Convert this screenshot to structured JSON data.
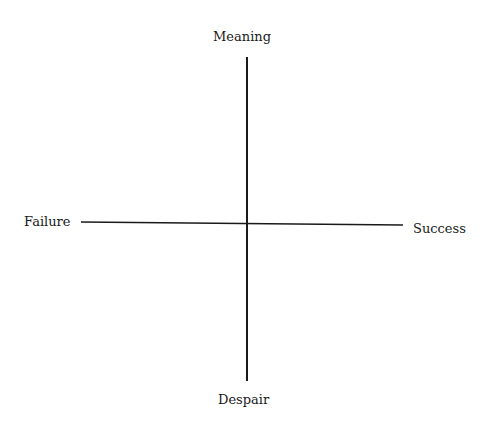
{
  "diagram": {
    "type": "quadrant-axes",
    "axes": {
      "vertical": {
        "top_label": "Meaning",
        "bottom_label": "Despair"
      },
      "horizontal": {
        "left_label": "Failure",
        "right_label": "Success"
      }
    },
    "colors": {
      "line": "#1a1a1a",
      "background": "#ffffff"
    }
  }
}
